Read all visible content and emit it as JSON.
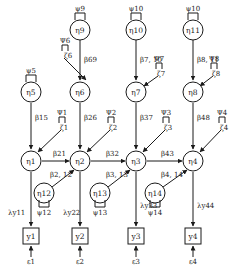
{
  "diagram": {
    "type": "path_diagram",
    "nodes": {
      "eta": [
        {
          "id": "eta1",
          "label": "η1"
        },
        {
          "id": "eta2",
          "label": "η2"
        },
        {
          "id": "eta3",
          "label": "η3"
        },
        {
          "id": "eta4",
          "label": "η4"
        },
        {
          "id": "eta5",
          "label": "η5"
        },
        {
          "id": "eta6",
          "label": "η6"
        },
        {
          "id": "eta7",
          "label": "η7"
        },
        {
          "id": "eta8",
          "label": "η8"
        },
        {
          "id": "eta9",
          "label": "η9"
        },
        {
          "id": "eta10",
          "label": "η10"
        },
        {
          "id": "eta11",
          "label": "η11"
        },
        {
          "id": "eta12",
          "label": "η12"
        },
        {
          "id": "eta13",
          "label": "η13"
        },
        {
          "id": "eta14",
          "label": "η14"
        }
      ],
      "observed": [
        {
          "id": "y1",
          "label": "y1"
        },
        {
          "id": "y2",
          "label": "y2"
        },
        {
          "id": "y3",
          "label": "y3"
        },
        {
          "id": "y4",
          "label": "y4"
        }
      ]
    },
    "variances": {
      "psi5": "ψ5",
      "psi9": "ψ9",
      "psi10_above_eta10": "ψ10",
      "psi_above_eta11": "ψ10",
      "psi12": "ψ12",
      "psi13": "ψ13",
      "psi14": "ψ14",
      "psi1": "Ψ1",
      "psi2": "Ψ2",
      "psi3": "Ψ3",
      "psi4": "Ψ4",
      "psi6": "Ψ6",
      "psi7": "Ψ7",
      "psi8": "Ψ8"
    },
    "disturbances": {
      "zeta1": "ζ1",
      "zeta2": "ζ2",
      "zeta3": "ζ3",
      "zeta4": "ζ4",
      "zeta6": "ζ6",
      "zeta7": "ζ7",
      "zeta8": "ζ8"
    },
    "paths": {
      "b15": "β15",
      "b21": "β21",
      "b26": "β26",
      "b32": "β32",
      "b37": "β37",
      "b43": "β43",
      "b48": "β48",
      "b69": "β69",
      "b7_10": "β7, 10",
      "b8_11": "β8, 11",
      "b2_12": "β2, 12",
      "b3_13": "β3, 13",
      "b4_14": "β4, 14"
    },
    "loadings": {
      "l11": "λy11",
      "l22": "λy22",
      "l33": "λy33",
      "l44": "λy44"
    },
    "errors": {
      "e1": "ε1",
      "e2": "ε2",
      "e3": "ε3",
      "e4": "ε4"
    },
    "uncertain_readings": [
      "Variance label above η11 reads most plausibly as ψ10 at source resolution, though the naming pattern would suggest ψ11. Left as read, not verified."
    ]
  }
}
